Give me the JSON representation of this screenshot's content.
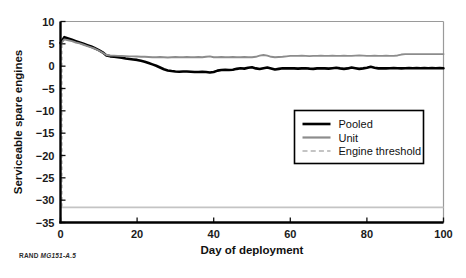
{
  "figure": {
    "credit_brand": "RAND",
    "credit_id": "MG151-A.5"
  },
  "legend": {
    "position": "center-right",
    "items": [
      {
        "label": "Pooled",
        "color": "#000000",
        "style": "solid",
        "width": 2.6
      },
      {
        "label": "Unit",
        "color": "#8c8c8c",
        "style": "solid",
        "width": 2.2
      },
      {
        "label": "Engine threshold",
        "color": "#c4c4c4",
        "style": "dashed",
        "width": 1.8
      }
    ]
  },
  "chart_data": {
    "type": "line",
    "title": "",
    "xlabel": "Day of deployment",
    "ylabel": "Serviceable spare engines",
    "xlim": [
      0,
      100
    ],
    "ylim": [
      -35,
      10
    ],
    "xticks": [
      0,
      20,
      40,
      60,
      80,
      100
    ],
    "yticks": [
      10,
      5,
      0,
      -5,
      -10,
      -15,
      -20,
      -25,
      -30,
      -35
    ],
    "xtick_labels": [
      "0",
      "20",
      "40",
      "60",
      "80",
      "100"
    ],
    "ytick_labels": [
      "10",
      "5",
      "0",
      "−5",
      "−10",
      "−15",
      "−20",
      "−25",
      "−30",
      "−35"
    ],
    "grid": false,
    "legend_position": "center-right",
    "threshold_value": -31.6,
    "series": [
      {
        "name": "Pooled",
        "color": "#000000",
        "style": "solid",
        "x": [
          0,
          1,
          2,
          3,
          4,
          5,
          6,
          7,
          8,
          9,
          10,
          11,
          12,
          13,
          14,
          15,
          16,
          17,
          18,
          19,
          20,
          21,
          22,
          23,
          24,
          25,
          26,
          27,
          28,
          29,
          30,
          31,
          32,
          33,
          34,
          35,
          36,
          37,
          38,
          39,
          40,
          41,
          42,
          43,
          44,
          45,
          46,
          47,
          48,
          49,
          50,
          51,
          52,
          53,
          54,
          55,
          56,
          57,
          58,
          59,
          60,
          61,
          62,
          63,
          64,
          65,
          66,
          67,
          68,
          69,
          70,
          71,
          72,
          73,
          74,
          75,
          76,
          77,
          78,
          79,
          80,
          81,
          82,
          83,
          84,
          85,
          86,
          87,
          88,
          89,
          90,
          91,
          92,
          93,
          94,
          95,
          96,
          97,
          98,
          99,
          100
        ],
        "y": [
          5.2,
          6.5,
          6.2,
          5.9,
          5.6,
          5.3,
          5.0,
          4.7,
          4.4,
          4.0,
          3.6,
          3.1,
          2.4,
          2.2,
          2.1,
          2.0,
          1.9,
          1.7,
          1.6,
          1.5,
          1.4,
          1.2,
          1.0,
          0.7,
          0.4,
          0.1,
          -0.3,
          -0.7,
          -0.95,
          -1.1,
          -1.2,
          -1.25,
          -1.2,
          -1.2,
          -1.25,
          -1.3,
          -1.3,
          -1.25,
          -1.3,
          -1.4,
          -1.3,
          -1.0,
          -0.85,
          -0.8,
          -0.85,
          -0.8,
          -0.6,
          -0.45,
          -0.55,
          -0.35,
          -0.25,
          -0.5,
          -0.65,
          -0.45,
          -0.3,
          -0.5,
          -0.75,
          -0.6,
          -0.45,
          -0.5,
          -0.45,
          -0.5,
          -0.55,
          -0.5,
          -0.45,
          -0.55,
          -0.6,
          -0.5,
          -0.45,
          -0.5,
          -0.55,
          -0.45,
          -0.35,
          -0.5,
          -0.6,
          -0.5,
          -0.3,
          -0.45,
          -0.6,
          -0.5,
          -0.35,
          -0.15,
          -0.35,
          -0.5,
          -0.45,
          -0.5,
          -0.45,
          -0.4,
          -0.45,
          -0.5,
          -0.45,
          -0.4,
          -0.45,
          -0.4,
          -0.45,
          -0.4,
          -0.45,
          -0.4,
          -0.45,
          -0.4,
          -0.45
        ]
      },
      {
        "name": "Unit",
        "color": "#8c8c8c",
        "style": "solid",
        "x": [
          0,
          1,
          2,
          3,
          4,
          5,
          6,
          7,
          8,
          9,
          10,
          11,
          12,
          13,
          14,
          15,
          16,
          17,
          18,
          19,
          20,
          21,
          22,
          23,
          24,
          25,
          26,
          27,
          28,
          29,
          30,
          31,
          32,
          33,
          34,
          35,
          36,
          37,
          38,
          39,
          40,
          41,
          42,
          43,
          44,
          45,
          46,
          47,
          48,
          49,
          50,
          51,
          52,
          53,
          54,
          55,
          56,
          57,
          58,
          59,
          60,
          61,
          62,
          63,
          64,
          65,
          66,
          67,
          68,
          69,
          70,
          71,
          72,
          73,
          74,
          75,
          76,
          77,
          78,
          79,
          80,
          81,
          82,
          83,
          84,
          85,
          86,
          87,
          88,
          89,
          90,
          91,
          92,
          93,
          94,
          95,
          96,
          97,
          98,
          99,
          100
        ],
        "y": [
          5.0,
          6.0,
          5.8,
          5.6,
          5.3,
          5.1,
          4.8,
          4.5,
          4.2,
          3.9,
          3.5,
          3.0,
          2.5,
          2.4,
          2.35,
          2.3,
          2.3,
          2.25,
          2.2,
          2.2,
          2.15,
          2.1,
          2.1,
          2.05,
          2.0,
          2.0,
          2.05,
          2.0,
          1.95,
          2.0,
          2.05,
          2.0,
          2.0,
          2.05,
          2.0,
          2.0,
          2.05,
          2.0,
          2.1,
          2.2,
          2.0,
          2.0,
          2.05,
          2.0,
          2.0,
          2.05,
          2.0,
          2.0,
          2.05,
          2.0,
          2.0,
          2.1,
          2.35,
          2.5,
          2.35,
          2.1,
          2.0,
          2.05,
          2.1,
          2.2,
          2.3,
          2.3,
          2.3,
          2.35,
          2.3,
          2.25,
          2.3,
          2.3,
          2.35,
          2.3,
          2.3,
          2.35,
          2.3,
          2.3,
          2.35,
          2.3,
          2.3,
          2.35,
          2.4,
          2.35,
          2.3,
          2.3,
          2.35,
          2.3,
          2.3,
          2.35,
          2.3,
          2.3,
          2.4,
          2.6,
          2.7,
          2.7,
          2.7,
          2.7,
          2.7,
          2.7,
          2.7,
          2.7,
          2.7,
          2.7,
          2.7
        ]
      }
    ]
  }
}
